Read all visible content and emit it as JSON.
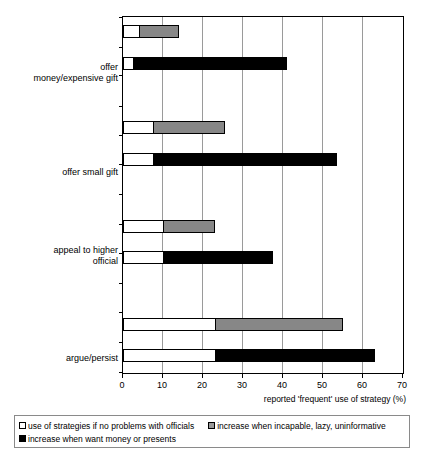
{
  "chart_data": {
    "type": "bar",
    "orientation": "horizontal",
    "title": "",
    "xlabel": "reported 'frequent' use of strategy (%)",
    "ylabel": "",
    "xlim": [
      0,
      70
    ],
    "xticks": [
      0,
      10,
      20,
      30,
      40,
      50,
      60,
      70
    ],
    "grid": true,
    "legend_position": "bottom",
    "stacked": true,
    "categories": [
      "offer\nmoney/expensive gift",
      "offer small gift",
      "appeal to higher\nofficial",
      "argue/persist"
    ],
    "series": [
      {
        "name": "use of strategies if no problems with officials",
        "color": "#ffffff",
        "values_incapable_bar": [
          4,
          7.5,
          10,
          23
        ],
        "values_money_bar": [
          2.5,
          7.5,
          10,
          23
        ]
      },
      {
        "name": "increase when incapable, lazy, uninformative",
        "color": "#878787",
        "values": [
          10,
          18,
          13,
          32
        ],
        "cumulative_totals": [
          14,
          25.5,
          23,
          55
        ]
      },
      {
        "name": "increase when want money or presents",
        "color": "#000000",
        "values": [
          38.5,
          46,
          27.5,
          40
        ],
        "cumulative_totals": [
          41,
          53.5,
          37.5,
          63
        ]
      }
    ],
    "groups": [
      {
        "label_line1": "offer",
        "label_line2": "money/expensive gift",
        "incapable_bar": {
          "base": 4,
          "total": 14
        },
        "money_bar": {
          "base": 2.5,
          "total": 41
        }
      },
      {
        "label_line1": "offer small gift",
        "label_line2": "",
        "incapable_bar": {
          "base": 7.5,
          "total": 25.5
        },
        "money_bar": {
          "base": 7.5,
          "total": 53.5
        }
      },
      {
        "label_line1": "appeal to higher",
        "label_line2": "official",
        "incapable_bar": {
          "base": 10,
          "total": 23
        },
        "money_bar": {
          "base": 10,
          "total": 37.5
        }
      },
      {
        "label_line1": "argue/persist",
        "label_line2": "",
        "incapable_bar": {
          "base": 23,
          "total": 55
        },
        "money_bar": {
          "base": 23,
          "total": 63
        }
      }
    ]
  },
  "axis": {
    "x_title": "reported 'frequent' use of strategy (%)",
    "tick_labels": [
      "0",
      "10",
      "20",
      "30",
      "40",
      "50",
      "60",
      "70"
    ]
  },
  "category_labels": [
    {
      "line1": "offer",
      "line2": "money/expensive gift"
    },
    {
      "line1": "offer small gift",
      "line2": ""
    },
    {
      "line1": "appeal to higher",
      "line2": "official"
    },
    {
      "line1": "argue/persist",
      "line2": ""
    }
  ],
  "legend": {
    "items": [
      {
        "label": "use of strategies if no problems with officials",
        "swatch": "white",
        "color": "#ffffff"
      },
      {
        "label": "increase when incapable, lazy, uninformative",
        "swatch": "gray",
        "color": "#878787"
      },
      {
        "label": "increase when want money or presents",
        "swatch": "black",
        "color": "#000000"
      }
    ]
  }
}
